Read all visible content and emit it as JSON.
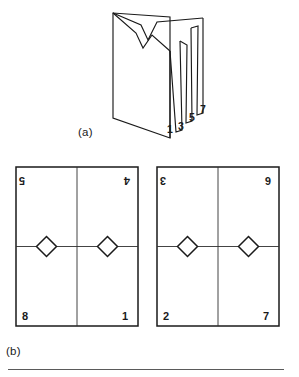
{
  "figure": {
    "stroke_color": "#1a1a1a",
    "thin_stroke_color": "#3a3a3a",
    "background": "#ffffff",
    "panel_a": {
      "caption": "(a)",
      "description": "accordion-folded sheet of paper shown in perspective",
      "fold_labels": [
        {
          "text": "1",
          "x": 170,
          "y": 129
        },
        {
          "text": "3",
          "x": 180,
          "y": 124
        },
        {
          "text": "5",
          "x": 188,
          "y": 116
        },
        {
          "text": "7",
          "x": 198,
          "y": 110
        }
      ],
      "outline_points": "114,13 114,118 170,137 170,17 114,13",
      "flap_paths": [
        "M114,13 L140,25 L148,39 L157,22 L171,17",
        "M114,13 L136,33 L142,48 L152,36 L170,51",
        "M170,17 L170,137",
        "M170,51 L176,131",
        "M176,131 L182,129 L180,40",
        "M180,40 L187,44 L186,122",
        "M186,122 L192,120 L191,27",
        "M191,27 L198,25 L197,114",
        "M197,114 L203,112 L203,18",
        "M203,18 L171,17"
      ]
    },
    "panel_b": {
      "caption": "(b)",
      "description": "two unfolded rectangular sheets each divided into four quadrants with diamond shapes on the centre line",
      "sheets": [
        {
          "name": "left-sheet",
          "x": 16,
          "y": 167,
          "width": 122,
          "height": 159,
          "corner_numbers": {
            "top_left": "5",
            "top_right": "4",
            "bottom_left": "8",
            "bottom_right": "1"
          },
          "top_numbers_rotated": true,
          "bottom_numbers_rotated": false,
          "diamonds": 2
        },
        {
          "name": "right-sheet",
          "x": 157,
          "y": 167,
          "width": 122,
          "height": 159,
          "corner_numbers": {
            "top_left": "3",
            "top_right": "6",
            "bottom_left": "2",
            "bottom_right": "7"
          },
          "top_numbers_rotated": true,
          "bottom_numbers_rotated": false,
          "diamonds": 2
        }
      ]
    }
  }
}
